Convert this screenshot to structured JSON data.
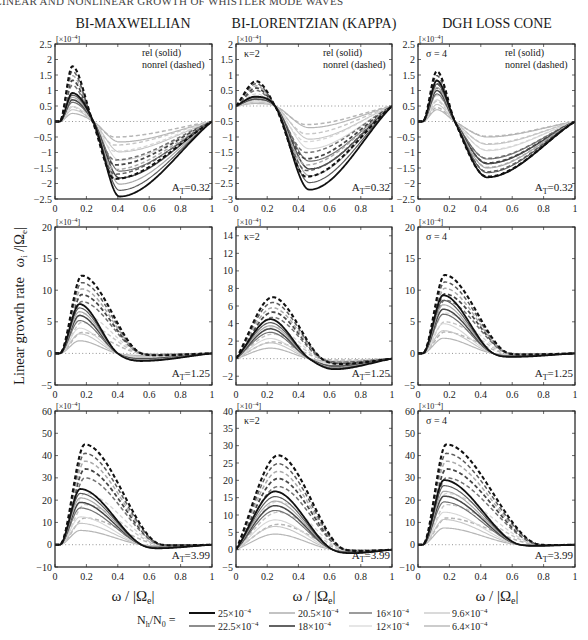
{
  "header": {
    "running_title": "LINEAR AND NONLINEAR GROWTH OF WHISTLER MODE WAVES"
  },
  "columns": [
    {
      "title": "BI-MAXWELLIAN"
    },
    {
      "title": "BI-LORENTZIAN (KAPPA)"
    },
    {
      "title": "DGH LOSS CONE"
    }
  ],
  "y_axis_label": {
    "text": "Linear growth rate",
    "symbol": "ω",
    "sub1": "i",
    "mid": " /|Ω",
    "sub2": "e",
    "end": "|"
  },
  "x_axis_label": {
    "symbol": "ω / |Ω",
    "sub": "e",
    "end": "|"
  },
  "annotations": {
    "rel": "rel (solid)",
    "nonrel": "nonrel (dashed)",
    "scale_prefix": "[×10",
    "scale_exp": "−4",
    "scale_suffix": "]"
  },
  "legend": {
    "label_main": "N",
    "label_sub1": "h",
    "label_mid": "/N",
    "label_sub2": "0",
    "label_eq": " =",
    "entries": [
      {
        "mant": "25×10",
        "exp": "−4",
        "color": "#111111",
        "width": 2.0
      },
      {
        "mant": "22.5×10",
        "exp": "−4",
        "color": "#5c5c5c",
        "width": 1.4
      },
      {
        "mant": "20.5×10",
        "exp": "−4",
        "color": "#aaaaaa",
        "width": 1.4
      },
      {
        "mant": "18×10",
        "exp": "−4",
        "color": "#474747",
        "width": 1.7
      },
      {
        "mant": "16×10",
        "exp": "−4",
        "color": "#727272",
        "width": 1.4
      },
      {
        "mant": "12×10",
        "exp": "−4",
        "color": "#d6d6d6",
        "width": 1.2
      },
      {
        "mant": "9.6×10",
        "exp": "−4",
        "color": "#c6c6c6",
        "width": 1.3
      },
      {
        "mant": "6.4×10",
        "exp": "−4",
        "color": "#b6b6b6",
        "width": 1.4
      }
    ]
  },
  "chart_data": [
    {
      "type": "line",
      "title": "BI-MAXWELLIAN",
      "param_label": "",
      "show_rel_nonrel": true,
      "at_label": {
        "A": "A",
        "sub": "T",
        "value": "=0.32"
      },
      "xlabel": "ω/|Ωe|",
      "ylabel": "Linear growth rate ωi/|Ωe|",
      "y_scale": "×10^-4",
      "xlim": [
        0,
        1
      ],
      "ylim": [
        -2.5,
        2.5
      ],
      "grid": false,
      "xticks": [
        0,
        0.2,
        0.4,
        0.6,
        0.8,
        1
      ],
      "xtick_labels": [
        "0",
        "0.2",
        "0.4",
        "0.6",
        "0.8",
        "1"
      ],
      "yticks": [
        2.5,
        2,
        1.5,
        1,
        0.5,
        0,
        -0.5,
        -1,
        -1.5,
        -2,
        -2.5
      ],
      "ytick_labels": [
        "2.5",
        "2",
        "1.5",
        "1",
        "0.5",
        "0",
        "−0.5",
        "−1",
        "−1.5",
        "−2",
        "−2.5"
      ],
      "rel": {
        "x_start": 0.03,
        "peak_x": 0.11,
        "cross_x": 0.245,
        "trough_x": 0.41,
        "peaks": [
          0.92,
          0.85,
          0.78,
          0.7,
          0.62,
          0.48,
          0.38,
          0.26
        ],
        "troughs": [
          -2.42,
          -2.22,
          -2.02,
          -1.82,
          -1.6,
          -1.25,
          -0.98,
          -0.66
        ]
      },
      "nonrel": {
        "x_start": 0.03,
        "peak_x": 0.11,
        "cross_x": 0.24,
        "trough_x": 0.38,
        "peaks": [
          1.78,
          1.62,
          1.48,
          1.33,
          1.17,
          0.9,
          0.71,
          0.48
        ],
        "troughs": [
          -1.85,
          -1.7,
          -1.55,
          -1.4,
          -1.24,
          -0.96,
          -0.76,
          -0.5
        ]
      }
    },
    {
      "type": "line",
      "title": "BI-LORENTZIAN (KAPPA)",
      "param_label": "κ=2",
      "show_rel_nonrel": true,
      "at_label": {
        "A": "A",
        "sub": "T",
        "value": "=0.32"
      },
      "xlabel": "ω/|Ωe|",
      "ylabel": "Linear growth rate ωi/|Ωe|",
      "y_scale": "×10^-4",
      "xlim": [
        0,
        1
      ],
      "ylim": [
        -3,
        2
      ],
      "grid": false,
      "xticks": [
        0,
        0.2,
        0.4,
        0.6,
        0.8,
        1
      ],
      "xtick_labels": [
        "0",
        "0.2",
        "0.4",
        "0.6",
        "0.8",
        "1"
      ],
      "yticks": [
        2,
        1.5,
        1,
        0.5,
        0,
        -0.5,
        -1,
        -1.5,
        -2,
        -2.5,
        -3
      ],
      "ytick_labels": [
        "2",
        "1.5",
        "1",
        "0.5",
        "0",
        "−0.5",
        "−1",
        "−1.5",
        "−2",
        "−2.5",
        "−3"
      ],
      "rel": {
        "x_start": 0,
        "peak_x": 0.12,
        "cross_x": 0.25,
        "trough_x": 0.47,
        "peaks": [
          0.3,
          0.28,
          0.26,
          0.23,
          0.21,
          0.16,
          0.12,
          0.08
        ],
        "troughs": [
          -2.7,
          -2.47,
          -2.25,
          -2.03,
          -1.78,
          -1.38,
          -1.07,
          -0.7
        ]
      },
      "nonrel": {
        "x_start": 0,
        "peak_x": 0.13,
        "cross_x": 0.25,
        "trough_x": 0.45,
        "peaks": [
          0.8,
          0.72,
          0.65,
          0.58,
          0.5,
          0.39,
          0.3,
          0.2
        ],
        "troughs": [
          -2.28,
          -2.08,
          -1.9,
          -1.7,
          -1.5,
          -1.15,
          -0.9,
          -0.6
        ]
      }
    },
    {
      "type": "line",
      "title": "DGH LOSS CONE",
      "param_label": "σ = 4",
      "show_rel_nonrel": true,
      "at_label": {
        "A": "A",
        "sub": "T",
        "value": "=0.32"
      },
      "xlabel": "ω/|Ωe|",
      "ylabel": "Linear growth rate ωi/|Ωe|",
      "y_scale": "×10^-4",
      "xlim": [
        0,
        1
      ],
      "ylim": [
        -2.5,
        2.5
      ],
      "grid": false,
      "xticks": [
        0,
        0.2,
        0.4,
        0.6,
        0.8,
        1
      ],
      "xtick_labels": [
        "0",
        "0.2",
        "0.4",
        "0.6",
        "0.8",
        "1"
      ],
      "yticks": [
        2.5,
        2,
        1.5,
        1,
        0.5,
        0,
        -0.5,
        -1,
        -1.5,
        -2,
        -2.5
      ],
      "ytick_labels": [
        "2.5",
        "2",
        "1.5",
        "1",
        "0.5",
        "0",
        "−0.5",
        "−1",
        "−1.5",
        "−2",
        "−2.5"
      ],
      "rel": {
        "x_start": 0.03,
        "peak_x": 0.12,
        "cross_x": 0.235,
        "trough_x": 0.44,
        "peaks": [
          1.32,
          1.21,
          1.1,
          1.0,
          0.89,
          0.7,
          0.55,
          0.38
        ],
        "troughs": [
          -1.8,
          -1.65,
          -1.5,
          -1.36,
          -1.21,
          -0.94,
          -0.74,
          -0.5
        ]
      },
      "nonrel": {
        "x_start": 0.03,
        "peak_x": 0.12,
        "cross_x": 0.235,
        "trough_x": 0.44,
        "peaks": [
          1.62,
          1.48,
          1.35,
          1.22,
          1.08,
          0.84,
          0.66,
          0.45
        ],
        "troughs": [
          -1.78,
          -1.62,
          -1.48,
          -1.34,
          -1.19,
          -0.92,
          -0.72,
          -0.48
        ]
      }
    },
    {
      "type": "line",
      "title": "BI-MAXWELLIAN",
      "param_label": "",
      "show_rel_nonrel": false,
      "at_label": {
        "A": "A",
        "sub": "T",
        "value": "=1.25"
      },
      "xlabel": "ω/|Ωe|",
      "ylabel": "Linear growth rate ωi/|Ωe|",
      "y_scale": "×10^-4",
      "xlim": [
        0,
        1
      ],
      "ylim": [
        -5,
        20
      ],
      "grid": false,
      "xticks": [
        0,
        0.2,
        0.4,
        0.6,
        0.8,
        1
      ],
      "xtick_labels": [
        "0",
        "0.2",
        "0.4",
        "0.6",
        "0.8",
        "1"
      ],
      "yticks": [
        20,
        15,
        10,
        5,
        0,
        -5
      ],
      "ytick_labels": [
        "20",
        "15",
        "10",
        "5",
        "0",
        "−5"
      ],
      "rel": {
        "x_start": 0.03,
        "peak_x": 0.155,
        "cross_x": 0.4,
        "trough_x": 0.55,
        "peaks": [
          7.8,
          7.2,
          6.6,
          6.0,
          5.2,
          4.0,
          3.1,
          2.0
        ],
        "troughs": [
          -1.2,
          -1.1,
          -1.0,
          -0.9,
          -0.8,
          -0.62,
          -0.48,
          -0.32
        ]
      },
      "nonrel": {
        "x_start": 0.03,
        "peak_x": 0.17,
        "cross_x": 0.55,
        "trough_x": 0.65,
        "peaks": [
          12.3,
          11.2,
          10.2,
          9.3,
          8.2,
          6.3,
          4.9,
          3.3
        ],
        "troughs": [
          -0.3,
          -0.28,
          -0.25,
          -0.22,
          -0.2,
          -0.15,
          -0.12,
          -0.08
        ]
      }
    },
    {
      "type": "line",
      "title": "BI-LORENTZIAN (KAPPA)",
      "param_label": "κ=2",
      "show_rel_nonrel": false,
      "at_label": {
        "A": "A",
        "sub": "T",
        "value": "=1.25"
      },
      "xlabel": "ω/|Ωe|",
      "ylabel": "Linear growth rate ωi/|Ωe|",
      "y_scale": "×10^-4",
      "xlim": [
        0,
        1
      ],
      "ylim": [
        -3,
        15
      ],
      "grid": false,
      "xticks": [
        0,
        0.2,
        0.4,
        0.6,
        0.8,
        1
      ],
      "xtick_labels": [
        "0",
        "0.2",
        "0.4",
        "0.6",
        "0.8",
        "1"
      ],
      "yticks": [
        14,
        12,
        10,
        8,
        6,
        4,
        2,
        0,
        -2
      ],
      "ytick_labels": [
        "14",
        "12",
        "10",
        "8",
        "6",
        "4",
        "2",
        "0",
        "−2"
      ],
      "rel": {
        "x_start": 0,
        "peak_x": 0.22,
        "cross_x": 0.47,
        "trough_x": 0.63,
        "peaks": [
          4.5,
          4.1,
          3.75,
          3.4,
          3.0,
          2.3,
          1.8,
          1.2
        ],
        "troughs": [
          -1.2,
          -1.1,
          -1.0,
          -0.9,
          -0.8,
          -0.62,
          -0.48,
          -0.32
        ]
      },
      "nonrel": {
        "x_start": 0,
        "peak_x": 0.235,
        "cross_x": 0.55,
        "trough_x": 0.68,
        "peaks": [
          7.0,
          6.4,
          5.8,
          5.3,
          4.7,
          3.6,
          2.8,
          1.9
        ],
        "troughs": [
          -0.6,
          -0.55,
          -0.5,
          -0.45,
          -0.4,
          -0.31,
          -0.24,
          -0.16
        ]
      }
    },
    {
      "type": "line",
      "title": "DGH LOSS CONE",
      "param_label": "σ = 4",
      "show_rel_nonrel": false,
      "at_label": {
        "A": "A",
        "sub": "T",
        "value": "=1.25"
      },
      "xlabel": "ω/|Ωe|",
      "ylabel": "Linear growth rate ωi/|Ωe|",
      "y_scale": "×10^-4",
      "xlim": [
        0,
        1
      ],
      "ylim": [
        -5,
        20
      ],
      "grid": false,
      "xticks": [
        0,
        0.2,
        0.4,
        0.6,
        0.8,
        1
      ],
      "xtick_labels": [
        "0",
        "0.2",
        "0.4",
        "0.6",
        "0.8",
        "1"
      ],
      "yticks": [
        20,
        15,
        10,
        5,
        0,
        -5
      ],
      "ytick_labels": [
        "20",
        "15",
        "10",
        "5",
        "0",
        "−5"
      ],
      "rel": {
        "x_start": 0.03,
        "peak_x": 0.16,
        "cross_x": 0.48,
        "trough_x": 0.6,
        "peaks": [
          9.2,
          8.4,
          7.7,
          7.0,
          6.2,
          4.7,
          3.6,
          2.4
        ],
        "troughs": [
          -0.55,
          -0.5,
          -0.46,
          -0.42,
          -0.37,
          -0.28,
          -0.22,
          -0.15
        ]
      },
      "nonrel": {
        "x_start": 0.03,
        "peak_x": 0.17,
        "cross_x": 0.58,
        "trough_x": 0.68,
        "peaks": [
          12.4,
          11.3,
          10.3,
          9.4,
          8.4,
          6.4,
          5.0,
          3.4
        ],
        "troughs": [
          -0.2,
          -0.18,
          -0.16,
          -0.15,
          -0.13,
          -0.1,
          -0.08,
          -0.05
        ]
      }
    },
    {
      "type": "line",
      "title": "BI-MAXWELLIAN",
      "param_label": "",
      "show_rel_nonrel": false,
      "at_label": {
        "A": "A",
        "sub": "T",
        "value": "=3.99"
      },
      "xlabel": "ω/|Ωe|",
      "ylabel": "Linear growth rate ωi/|Ωe|",
      "y_scale": "×10^-4",
      "xlim": [
        0,
        1
      ],
      "ylim": [
        -10,
        60
      ],
      "grid": false,
      "xticks": [
        0,
        0.2,
        0.4,
        0.6,
        0.8,
        1
      ],
      "xtick_labels": [
        "0",
        "0.2",
        "0.4",
        "0.6",
        "0.8",
        "1"
      ],
      "yticks": [
        60,
        50,
        40,
        30,
        20,
        10,
        0,
        -10
      ],
      "ytick_labels": [
        "60",
        "50",
        "40",
        "30",
        "20",
        "10",
        "0",
        "−10"
      ],
      "rel": {
        "x_start": 0.03,
        "peak_x": 0.16,
        "cross_x": 0.55,
        "trough_x": 0.65,
        "peaks": [
          25.0,
          23.0,
          21.0,
          19.0,
          16.5,
          12.5,
          9.6,
          6.4
        ],
        "troughs": [
          -1.6,
          -1.5,
          -1.4,
          -1.3,
          -1.1,
          -0.85,
          -0.65,
          -0.45
        ]
      },
      "nonrel": {
        "x_start": 0.03,
        "peak_x": 0.19,
        "cross_x": 0.68,
        "trough_x": 0.78,
        "peaks": [
          45,
          41,
          37.5,
          34,
          30,
          23,
          18,
          12
        ],
        "troughs": [
          -0.3,
          -0.28,
          -0.25,
          -0.22,
          -0.2,
          -0.15,
          -0.12,
          -0.08
        ]
      }
    },
    {
      "type": "line",
      "title": "BI-LORENTZIAN (KAPPA)",
      "param_label": "κ=2",
      "show_rel_nonrel": false,
      "at_label": {
        "A": "A",
        "sub": "T",
        "value": "=3.99"
      },
      "xlabel": "ω/|Ωe|",
      "ylabel": "Linear growth rate ωi/|Ωe|",
      "y_scale": "×10^-4",
      "xlim": [
        0,
        1
      ],
      "ylim": [
        -5,
        40
      ],
      "grid": false,
      "xticks": [
        0,
        0.2,
        0.4,
        0.6,
        0.8,
        1
      ],
      "xtick_labels": [
        "0",
        "0.2",
        "0.4",
        "0.6",
        "0.8",
        "1"
      ],
      "yticks": [
        40,
        35,
        30,
        25,
        20,
        15,
        10,
        5,
        0,
        -5
      ],
      "ytick_labels": [
        "40",
        "35",
        "30",
        "25",
        "20",
        "15",
        "10",
        "5",
        "0",
        "−5"
      ],
      "rel": {
        "x_start": 0,
        "peak_x": 0.25,
        "cross_x": 0.62,
        "trough_x": 0.75,
        "peaks": [
          16.8,
          15.3,
          14.0,
          12.7,
          11.3,
          8.6,
          6.7,
          4.5
        ],
        "troughs": [
          -1.0,
          -0.92,
          -0.85,
          -0.77,
          -0.68,
          -0.52,
          -0.4,
          -0.27
        ]
      },
      "nonrel": {
        "x_start": 0,
        "peak_x": 0.27,
        "cross_x": 0.7,
        "trough_x": 0.82,
        "peaks": [
          27.2,
          24.8,
          22.6,
          20.5,
          18.2,
          13.9,
          10.8,
          7.3
        ],
        "troughs": [
          -0.4,
          -0.37,
          -0.34,
          -0.3,
          -0.27,
          -0.2,
          -0.16,
          -0.1
        ]
      }
    },
    {
      "type": "line",
      "title": "DGH LOSS CONE",
      "param_label": "σ = 4",
      "show_rel_nonrel": false,
      "at_label": {
        "A": "A",
        "sub": "T",
        "value": "=3.99"
      },
      "xlabel": "ω/|Ωe|",
      "ylabel": "Linear growth rate ωi/|Ωe|",
      "y_scale": "×10^-4",
      "xlim": [
        0,
        1
      ],
      "ylim": [
        -10,
        60
      ],
      "grid": false,
      "xticks": [
        0,
        0.2,
        0.4,
        0.6,
        0.8,
        1
      ],
      "xtick_labels": [
        "0",
        "0.2",
        "0.4",
        "0.6",
        "0.8",
        "1"
      ],
      "yticks": [
        60,
        50,
        40,
        30,
        20,
        10,
        0,
        -10
      ],
      "ytick_labels": [
        "60",
        "50",
        "40",
        "30",
        "20",
        "10",
        "0",
        "−10"
      ],
      "rel": {
        "x_start": 0.03,
        "peak_x": 0.165,
        "cross_x": 0.65,
        "trough_x": 0.75,
        "peaks": [
          29.0,
          26.5,
          24.0,
          21.8,
          19.2,
          14.6,
          11.3,
          7.5
        ],
        "troughs": [
          -0.5,
          -0.46,
          -0.42,
          -0.38,
          -0.34,
          -0.26,
          -0.2,
          -0.13
        ]
      },
      "nonrel": {
        "x_start": 0.03,
        "peak_x": 0.18,
        "cross_x": 0.78,
        "trough_x": 0.86,
        "peaks": [
          45,
          41,
          37.5,
          34,
          30,
          23,
          18,
          12
        ],
        "troughs": [
          -0.15,
          -0.14,
          -0.12,
          -0.11,
          -0.1,
          -0.08,
          -0.06,
          -0.04
        ]
      }
    }
  ]
}
